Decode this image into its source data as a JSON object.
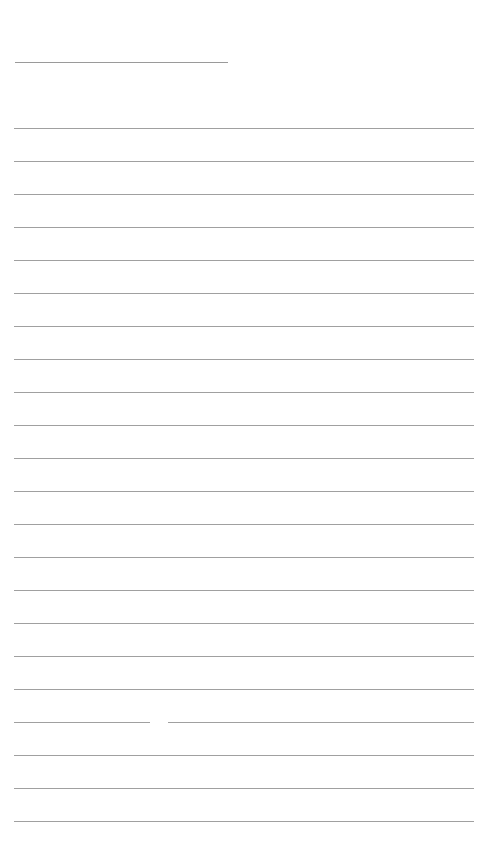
{
  "page": {
    "type": "lined-notebook-page",
    "background_color": "#ffffff",
    "line_color": "#a0a0a0",
    "title_line": {
      "x": 15,
      "y": 62,
      "width": 213
    },
    "rules": {
      "count": 22,
      "start_y": 128,
      "spacing": 33,
      "x": 14,
      "width": 460
    },
    "gap_line": {
      "index": 18,
      "gap_start_x": 150,
      "gap_end_x": 168
    }
  }
}
